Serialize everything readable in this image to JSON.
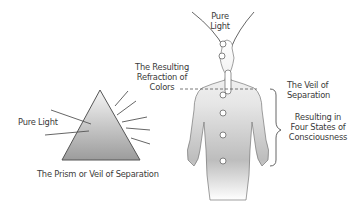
{
  "diagram": {
    "prism": {
      "input_label": "Pure Light",
      "output_label_lines": [
        "The Resulting",
        "Refraction of",
        "Colors"
      ],
      "caption": "The Prism or Veil of Separation",
      "incoming_rays": 2,
      "outgoing_rays": 5
    },
    "figure": {
      "top_label_lines": [
        "Pure",
        "Light"
      ],
      "veil_label_lines": [
        "The Veil of",
        "Separation"
      ],
      "states_label_lines": [
        "Resulting in",
        "Four States of",
        "Consciousness"
      ],
      "body_points": 6,
      "states_bracketed": 4
    },
    "colors": {
      "line": "#555555",
      "fill_light": "#f7f7f7",
      "fill_dark": "#9a9a9a",
      "text": "#3a3a3a"
    }
  }
}
